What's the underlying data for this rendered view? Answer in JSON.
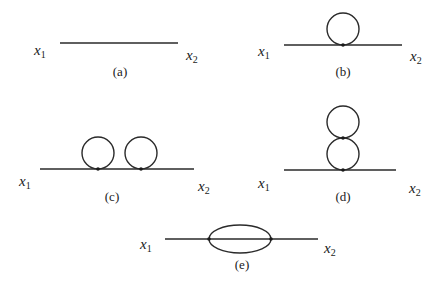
{
  "figure": {
    "type": "Feynman diagrams (propagator corrections)",
    "panels": [
      {
        "id": "a",
        "caption": "(a)",
        "left_label": "x",
        "left_sub": "1",
        "right_label": "x",
        "right_sub": "2",
        "description": "free propagator line",
        "loops": 0
      },
      {
        "id": "b",
        "caption": "(b)",
        "left_label": "x",
        "left_sub": "1",
        "right_label": "x",
        "right_sub": "2",
        "description": "single tadpole loop on line",
        "loops": 1
      },
      {
        "id": "c",
        "caption": "(c)",
        "left_label": "x",
        "left_sub": "1",
        "right_label": "x",
        "right_sub": "2",
        "description": "two tadpole loops side by side",
        "loops": 2
      },
      {
        "id": "d",
        "caption": "(d)",
        "left_label": "x",
        "left_sub": "1",
        "right_label": "x",
        "right_sub": "2",
        "description": "two stacked tadpole loops (double scoop)",
        "loops": 2
      },
      {
        "id": "e",
        "caption": "(e)",
        "left_label": "x",
        "left_sub": "1",
        "right_label": "x",
        "right_sub": "2",
        "description": "sunset diagram, ellipse with two vertices",
        "loops": 2
      }
    ],
    "colors": {
      "line": "#2a2a2a",
      "text": "#1a1a1a",
      "background": "#ffffff"
    }
  }
}
